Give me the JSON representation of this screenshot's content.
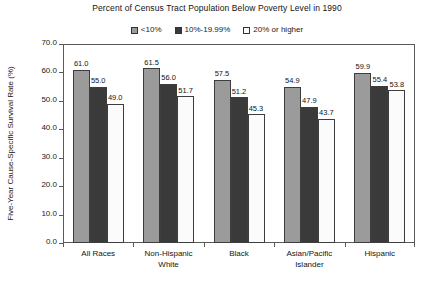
{
  "chart_data": {
    "type": "bar",
    "title": "Percent of Census Tract Population Below Poverty Level in 1990",
    "xlabel": "",
    "ylabel": "Five-Year Cause-Specific Survival Rate (%)",
    "ylim": [
      0,
      70
    ],
    "ytick_labels": [
      "70.0",
      "60.0",
      "50.0",
      "40.0",
      "30.0",
      "20.0",
      "10.0",
      "0.0"
    ],
    "ytick_values": [
      70,
      60,
      50,
      40,
      30,
      20,
      10,
      0
    ],
    "grid": false,
    "legend_position": "top-center",
    "categories": [
      "All Races",
      "Non-Hispanic White",
      "Black",
      "Asian/Pacific Islander",
      "Hispanic"
    ],
    "category_lines": [
      [
        "All Races"
      ],
      [
        "Non-Hispanic",
        "White"
      ],
      [
        "Black"
      ],
      [
        "Asian/Pacific",
        "Islander"
      ],
      [
        "Hispanic"
      ]
    ],
    "series": [
      {
        "name": "<10%",
        "color": "#9b9b9b",
        "values": [
          61.0,
          61.5,
          57.5,
          54.9,
          59.9
        ],
        "labels": [
          "61.0",
          "61.5",
          "57.5",
          "54.9",
          "59.9"
        ]
      },
      {
        "name": "10%-19.99%",
        "color": "#3a3a3a",
        "values": [
          55.0,
          56.0,
          51.2,
          47.9,
          55.4
        ],
        "labels": [
          "55.0",
          "56.0",
          "51.2",
          "47.9",
          "55.4"
        ]
      },
      {
        "name": "20% or higher",
        "color": "#fbfbfb",
        "values": [
          49.0,
          51.7,
          45.3,
          43.7,
          53.8
        ],
        "labels": [
          "49.0",
          "51.7",
          "45.3",
          "43.7",
          "53.8"
        ]
      }
    ]
  },
  "legend": {
    "items": [
      {
        "label": "<10%",
        "color": "#9b9b9b"
      },
      {
        "label": "10%-19.99%",
        "color": "#3a3a3a"
      },
      {
        "label": "20% or higher",
        "color": "#fbfbfb"
      }
    ]
  }
}
